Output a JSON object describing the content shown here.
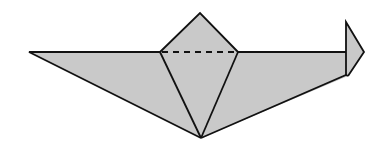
{
  "diagram": {
    "type": "origami-fold",
    "colors": {
      "fill": "#c9c9c9",
      "stroke": "#111111",
      "background": "#ffffff"
    },
    "points": {
      "left_tip": [
        29,
        52
      ],
      "fold_left": [
        160,
        52
      ],
      "top": [
        200,
        13
      ],
      "fold_right": [
        238,
        52
      ],
      "hook_base": [
        346,
        52
      ],
      "hook_top": [
        346,
        22
      ],
      "hook_tip": [
        364,
        52
      ],
      "hook_bottom": [
        348,
        76
      ],
      "bottom": [
        201,
        138
      ]
    }
  }
}
